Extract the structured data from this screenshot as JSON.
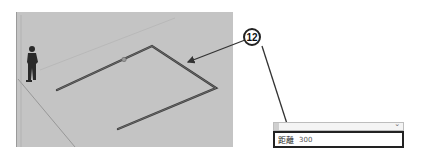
{
  "callout": {
    "number": "12"
  },
  "measurements": {
    "label": "距離",
    "value": "300"
  },
  "colors": {
    "viewport_bg": "#c4c4c4",
    "edge": "#444444",
    "callout_border": "#222222"
  }
}
